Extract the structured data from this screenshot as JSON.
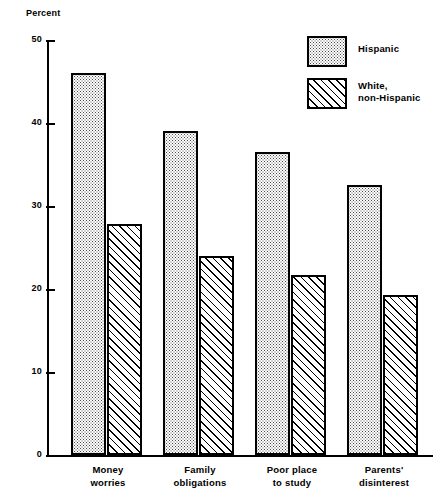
{
  "chart_data": {
    "type": "bar",
    "title": "",
    "subtitle": "",
    "xlabel": "",
    "ylabel": "Percent",
    "ylim": [
      0,
      50
    ],
    "yticks": [
      0,
      10,
      20,
      30,
      40,
      50
    ],
    "ytick_labels": [
      "0",
      "10",
      "20",
      "30",
      "40",
      "50"
    ],
    "grid": false,
    "legend_position": "top-right",
    "categories": [
      "Money\nworries",
      "Family\nobligations",
      "Poor place\nto study",
      "Parents'\ndisinterest"
    ],
    "series": [
      {
        "name": "Hispanic",
        "fill": "dotted",
        "values": [
          46.0,
          39.0,
          36.5,
          32.5
        ]
      },
      {
        "name": "White,\nnon-Hispanic",
        "fill": "diagonal-hatch",
        "values": [
          27.8,
          24.0,
          21.7,
          19.3
        ]
      }
    ]
  },
  "axis": {
    "y_title": "Percent"
  },
  "legend": {
    "items": [
      {
        "label": "Hispanic",
        "fill": "dotted"
      },
      {
        "label": "White,\nnon-Hispanic",
        "fill": "diagonal-hatch"
      }
    ]
  },
  "colors": {
    "ink": "#000000",
    "background": "#ffffff",
    "stipple": "#4a4a4a"
  }
}
